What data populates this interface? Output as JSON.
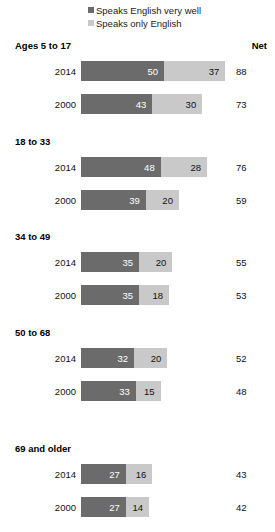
{
  "legend": {
    "items": [
      {
        "label": "Speaks English very well",
        "color": "#6b6b6b",
        "key": "very_well"
      },
      {
        "label": "Speaks only English",
        "color": "#c9c9c9",
        "key": "only_english"
      }
    ]
  },
  "net_header": "Net",
  "groups": [
    {
      "title": "Ages 5 to 17",
      "rows": [
        {
          "year": "2014",
          "very_well": 50,
          "only_english": 37,
          "net": 88
        },
        {
          "year": "2000",
          "very_well": 43,
          "only_english": 30,
          "net": 73
        }
      ]
    },
    {
      "title": "18 to 33",
      "rows": [
        {
          "year": "2014",
          "very_well": 48,
          "only_english": 28,
          "net": 76
        },
        {
          "year": "2000",
          "very_well": 39,
          "only_english": 20,
          "net": 59
        }
      ]
    },
    {
      "title": "34 to 49",
      "rows": [
        {
          "year": "2014",
          "very_well": 35,
          "only_english": 20,
          "net": 55
        },
        {
          "year": "2000",
          "very_well": 35,
          "only_english": 18,
          "net": 53
        }
      ]
    },
    {
      "title": "50 to 68",
      "rows": [
        {
          "year": "2014",
          "very_well": 32,
          "only_english": 20,
          "net": 52
        },
        {
          "year": "2000",
          "very_well": 33,
          "only_english": 15,
          "net": 48
        }
      ]
    },
    {
      "title": "69 and older",
      "rows": [
        {
          "year": "2014",
          "very_well": 27,
          "only_english": 16,
          "net": 43
        },
        {
          "year": "2000",
          "very_well": 27,
          "only_english": 14,
          "net": 42
        }
      ]
    }
  ],
  "chart_data": {
    "type": "bar",
    "title": "",
    "subtitle": "",
    "xlabel": "",
    "ylabel": "",
    "orientation": "horizontal",
    "stacked": true,
    "grid": false,
    "legend_position": "top",
    "xlim": [
      0,
      88
    ],
    "categories": [
      "Ages 5 to 17 / 2014",
      "Ages 5 to 17 / 2000",
      "18 to 33 / 2014",
      "18 to 33 / 2000",
      "34 to 49 / 2014",
      "34 to 49 / 2000",
      "50 to 68 / 2014",
      "50 to 68 / 2000",
      "69 and older / 2014",
      "69 and older / 2000"
    ],
    "series": [
      {
        "name": "Speaks English very well",
        "color": "#6b6b6b",
        "values": [
          50,
          43,
          48,
          39,
          35,
          35,
          32,
          33,
          27,
          27
        ]
      },
      {
        "name": "Speaks only English",
        "color": "#c9c9c9",
        "values": [
          37,
          30,
          28,
          20,
          20,
          18,
          20,
          15,
          16,
          14
        ]
      }
    ],
    "net": {
      "label": "Net",
      "values": [
        88,
        73,
        76,
        59,
        55,
        53,
        52,
        48,
        43,
        42
      ]
    },
    "annotations": []
  },
  "scale": {
    "px_per_unit": 1.66,
    "bar_left_px": 81
  }
}
